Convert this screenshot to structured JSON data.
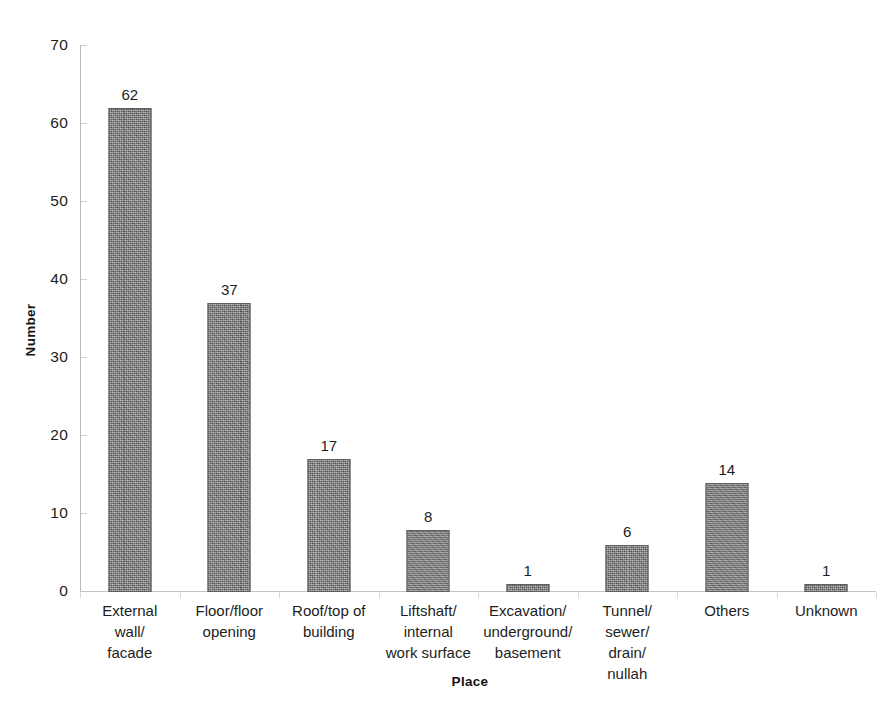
{
  "chart_data": {
    "type": "bar",
    "title": "",
    "subtitle": "",
    "xlabel": "Place",
    "ylabel": "Number",
    "categories": [
      "External\nwall/\nfacade",
      "Floor/floor\nopening",
      "Roof/top of\nbuilding",
      "Liftshaft/\ninternal\nwork surface",
      "Excavation/\nunderground/\nbasement",
      "Tunnel/\nsewer/\ndrain/\nnullah",
      "Others",
      "Unknown"
    ],
    "values": [
      62,
      37,
      17,
      8,
      1,
      6,
      14,
      1
    ],
    "data_labels": [
      "62",
      "37",
      "17",
      "8",
      "1",
      "6",
      "14",
      "1"
    ],
    "ylim": [
      0,
      70
    ],
    "ytick_values": [
      0,
      10,
      20,
      30,
      40,
      50,
      60,
      70
    ],
    "ytick_labels": [
      "0",
      "10",
      "20",
      "30",
      "40",
      "50",
      "60",
      "70"
    ],
    "grid": false,
    "legend": null,
    "legend_position": "none",
    "bar_color": "#7c7c7c",
    "bar_edge_color": "#5f5f5f",
    "axis_color": "#c0c0c0",
    "text_color": "#1d1d1d",
    "background": "#ffffff",
    "total": 146
  }
}
